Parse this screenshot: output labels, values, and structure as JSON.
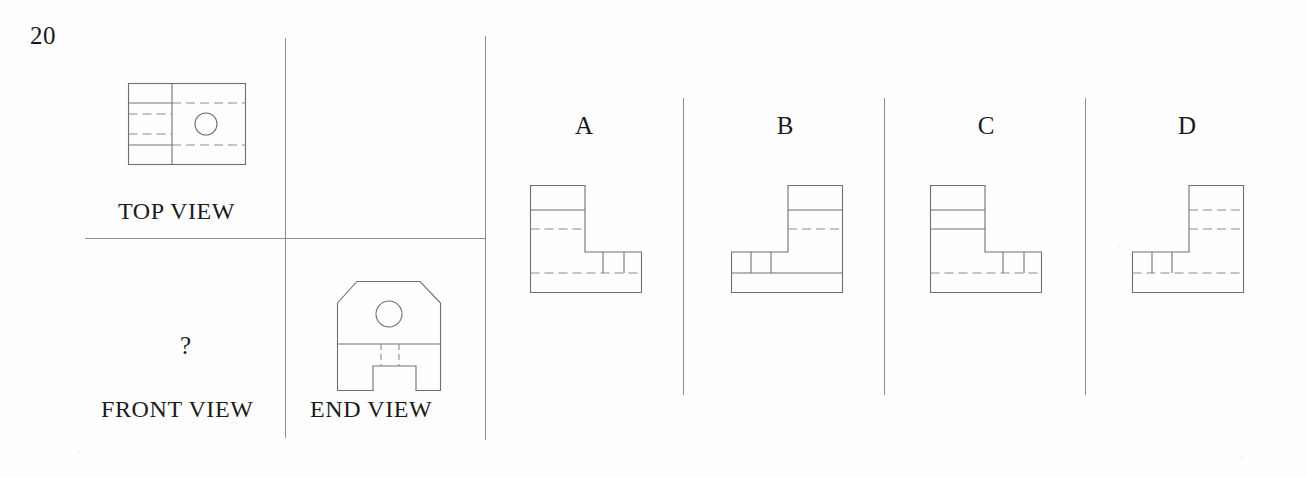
{
  "question": {
    "number": "20",
    "unknown_marker": "?"
  },
  "given_views": {
    "top": {
      "label": "TOP VIEW",
      "description": "rectangular plan with vertical division, two solid step lines, two hidden (dashed) lines on left half, dashed continuations on right half, and a through hole circle on right half"
    },
    "front": {
      "label": "FRONT VIEW",
      "description": "missing view, replaced by a question mark"
    },
    "end": {
      "label": "END VIEW",
      "description": "body with chamfered upper corners, circular through hole near top, horizontal parting line, and a rectangular notch cut into the bottom edge"
    }
  },
  "options": [
    {
      "letter": "A",
      "description": "L-shape with tall leg on the left; one solid horizontal line and one hidden horizontal line in the tall leg; notch detail with hidden line in the low right foot"
    },
    {
      "letter": "B",
      "description": "Mirrored L-shape with tall leg on the right; one solid and one hidden horizontal line in the tall leg; notch detail in the low left foot"
    },
    {
      "letter": "C",
      "description": "L-shape with tall leg on the left; two solid horizontal lines in the tall leg; long hidden line through the low right foot"
    },
    {
      "letter": "D",
      "description": "Mirrored L-shape with tall leg on the right; two hidden horizontal lines in the tall leg; notch detail in the low left foot"
    }
  ],
  "layout": {
    "divider_color": "#8e8e8e",
    "line_color": "#6f6f6f",
    "hidden_line_color": "#8a8a8a",
    "background": "#fefefe"
  }
}
